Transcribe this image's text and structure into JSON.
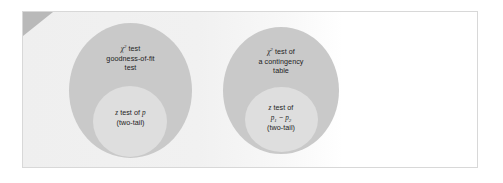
{
  "figure": {
    "background_color": "#ffffff",
    "panel_color": "#efefef",
    "frame_border_color": "#d8d8d8",
    "outer_set_color": "#c9c9c9",
    "inner_set_color": "#dedede",
    "text_color": "#1d1d1d",
    "corner_wedge_color": "#b9b9b9"
  },
  "diagram": {
    "type": "venn-nested-sets",
    "groups": [
      {
        "id": "goodness-of-fit",
        "outer": {
          "lines": [
            "test",
            "goodness-of-fit",
            "test"
          ],
          "symbol": "chi",
          "symbol_superscript": "2",
          "line1_prefix": "",
          "line1_suffix": " test"
        },
        "inner": {
          "lines": [
            "z test of p",
            "(two-tail)"
          ],
          "line1_italic_var": "z",
          "line1_rest": " test of ",
          "line1_var2": "p",
          "line2": "(two-tail)"
        }
      },
      {
        "id": "contingency-table",
        "outer": {
          "lines": [
            "test of",
            "a contingency",
            "table"
          ],
          "symbol": "chi",
          "symbol_superscript": "2",
          "line1_suffix": " test of",
          "line2": "a contingency",
          "line3": "table"
        },
        "inner": {
          "lines": [
            "z test of",
            "p1 - p2",
            "(two-tail)"
          ],
          "line1_italic_var": "z",
          "line1_rest": " test of",
          "line2_var_a": "p",
          "line2_sub_a": "1",
          "line2_operator": "−",
          "line2_var_b": "p",
          "line2_sub_b": "2",
          "line3": "(two-tail)"
        }
      }
    ]
  }
}
